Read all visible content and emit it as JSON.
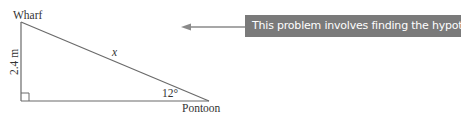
{
  "diagram": {
    "vertices": {
      "top_label": "Wharf",
      "bottom_right_label": "Pontoon"
    },
    "sides": {
      "vertical_label": "2.4 m",
      "hypotenuse_label": "x"
    },
    "angle_label": "12°",
    "right_angle_marker": true
  },
  "callout": {
    "text": "This problem involves finding the hypotenuse.",
    "background_color": "#7a7a7a",
    "text_color": "#ffffff"
  }
}
